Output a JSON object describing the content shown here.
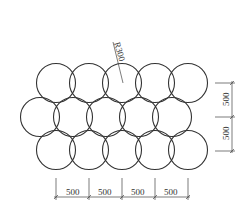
{
  "diagram": {
    "circle_radius_label": "R300",
    "circle_radius_px": 19.5,
    "rows": [
      {
        "y": 83,
        "x": [
          56,
          89,
          122,
          155,
          188
        ]
      },
      {
        "y": 117,
        "x": [
          40,
          73,
          106,
          139,
          172
        ]
      },
      {
        "y": 150,
        "x": [
          56,
          89,
          122,
          155,
          188
        ]
      }
    ],
    "horizontal_dimensions": [
      "500",
      "500",
      "500",
      "500"
    ],
    "vertical_dimensions": [
      "500",
      "500"
    ],
    "stroke_color": "#333333"
  }
}
